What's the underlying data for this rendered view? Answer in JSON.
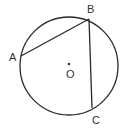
{
  "diagram": {
    "type": "geometry-circle",
    "stroke_color": "#2a2a2a",
    "label_color": "#333333",
    "circle": {
      "center": "O",
      "cx": 69,
      "cy": 66,
      "r": 49
    },
    "points": [
      {
        "name": "A",
        "label": "A",
        "x": 21,
        "y": 56,
        "label_x": 9,
        "label_y": 61
      },
      {
        "name": "B",
        "label": "B",
        "x": 89,
        "y": 19,
        "label_x": 87,
        "label_y": 13
      },
      {
        "name": "C",
        "label": "C",
        "x": 92,
        "y": 108,
        "label_x": 92,
        "label_y": 124
      }
    ],
    "center": {
      "label": "O",
      "x": 69,
      "y": 64,
      "label_x": 66,
      "label_y": 78
    },
    "segments": [
      {
        "from": "A",
        "to": "B"
      },
      {
        "from": "B",
        "to": "C"
      }
    ]
  }
}
